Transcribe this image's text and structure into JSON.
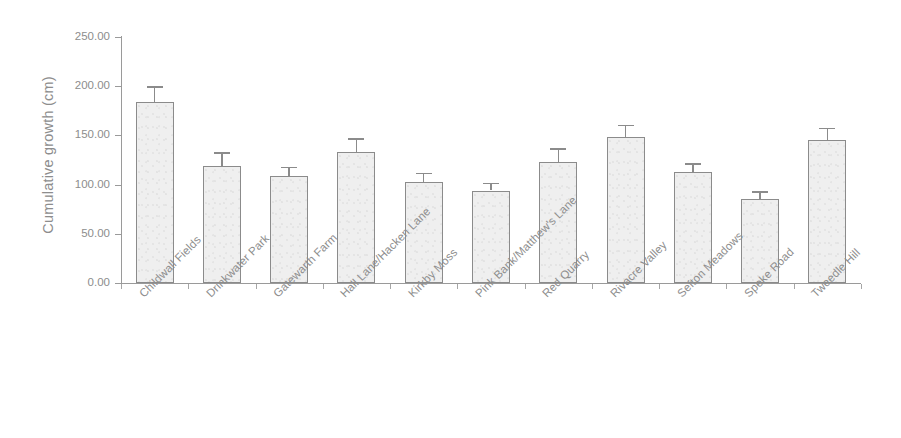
{
  "chart_data": {
    "type": "bar",
    "title": "",
    "xlabel": "",
    "ylabel": "Cumulative growth (cm)",
    "ylim": [
      0,
      250
    ],
    "ytick_labels": [
      "0.00",
      "50.00",
      "100.00",
      "150.00",
      "200.00",
      "250.00"
    ],
    "ytick_values": [
      0,
      50,
      100,
      150,
      200,
      250
    ],
    "grid": false,
    "legend": false,
    "error_bars": "upper only (standard error)",
    "categories": [
      "Childwall Fields",
      "Drinkwater Park",
      "Gatewarth Farm",
      "Hall Lane/Hacken Lane",
      "Kirkby Moss",
      "Pink Bank/Matthew's Lane",
      "Red Quarry",
      "Rivacre Valley",
      "Sefton Meadows",
      "Speke Road",
      "Tweedle Hill"
    ],
    "values": [
      184,
      119,
      109,
      133,
      103,
      94,
      123,
      148,
      113,
      85,
      145
    ],
    "errors": [
      16,
      14,
      9,
      14,
      9,
      8,
      14,
      13,
      9,
      8,
      13
    ]
  },
  "style": {
    "bar_fill": "#efefef",
    "bar_stroke": "#8b8b8b",
    "axis_color": "#9a9a9a",
    "text_color": "#8d8d8d",
    "background": "#ffffff"
  }
}
